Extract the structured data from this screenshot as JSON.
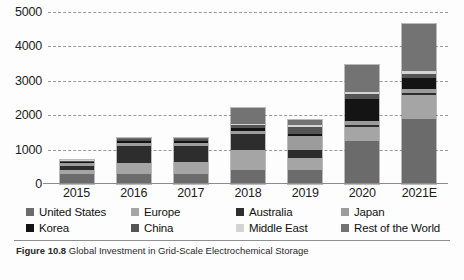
{
  "chart_data": {
    "type": "bar",
    "subtype": "stacked-bar",
    "title": "",
    "xlabel": "",
    "ylabel": "",
    "ylim": [
      0,
      5000
    ],
    "yticks": [
      "0",
      "1000",
      "2000",
      "3000",
      "4000",
      "5000"
    ],
    "grid": true,
    "grid_style": "dashed-horizontal",
    "legend_position": "bottom",
    "categories": [
      "2015",
      "2016",
      "2017",
      "2018",
      "2019",
      "2020",
      "2021E"
    ],
    "series": [
      {
        "name": "United States",
        "color": "#6b6b6b",
        "values": [
          300,
          300,
          300,
          400,
          400,
          1250,
          1900
        ]
      },
      {
        "name": "Europe",
        "color": "#a5a5a5",
        "values": [
          120,
          300,
          350,
          600,
          350,
          400,
          700
        ]
      },
      {
        "name": "Australia",
        "color": "#2d2d2d",
        "values": [
          100,
          500,
          450,
          450,
          250,
          80,
          60
        ]
      },
      {
        "name": "Japan",
        "color": "#9c9c9c",
        "values": [
          90,
          100,
          90,
          90,
          400,
          100,
          100
        ]
      },
      {
        "name": "Korea",
        "color": "#141414",
        "values": [
          40,
          60,
          60,
          100,
          60,
          650,
          320
        ]
      },
      {
        "name": "China",
        "color": "#555555",
        "values": [
          30,
          40,
          50,
          80,
          200,
          130,
          120
        ]
      },
      {
        "name": "Middle East",
        "color": "#d4d4d4",
        "values": [
          10,
          20,
          20,
          30,
          50,
          60,
          80
        ]
      },
      {
        "name": "Rest of the World",
        "color": "#737373",
        "values": [
          10,
          30,
          30,
          450,
          140,
          780,
          1370
        ]
      }
    ],
    "totals": [
      700,
      1350,
      1350,
      2200,
      1850,
      3450,
      4650
    ]
  },
  "legend": {
    "items": [
      {
        "label": "United States",
        "swatch": "#6b6b6b"
      },
      {
        "label": "Europe",
        "swatch": "#a5a5a5"
      },
      {
        "label": "Australia",
        "swatch": "#2d2d2d"
      },
      {
        "label": "Japan",
        "swatch": "#9c9c9c"
      },
      {
        "label": "Korea",
        "swatch": "#141414"
      },
      {
        "label": "China",
        "swatch": "#555555"
      },
      {
        "label": "Middle East",
        "swatch": "#d4d4d4"
      },
      {
        "label": "Rest of the World",
        "swatch": "#737373"
      }
    ]
  },
  "caption": {
    "number": "Figure 10.8",
    "text": "Global Investment in Grid-Scale Electrochemical Storage"
  }
}
